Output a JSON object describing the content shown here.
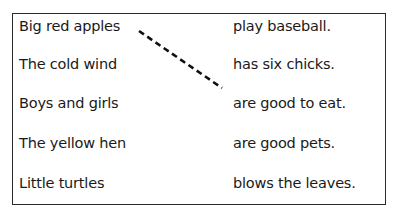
{
  "worksheet": {
    "left_items": [
      {
        "text": "Big red apples"
      },
      {
        "text": "The cold wind"
      },
      {
        "text": "Boys and girls"
      },
      {
        "text": "The yellow hen"
      },
      {
        "text": "Little turtles"
      }
    ],
    "right_items": [
      {
        "text": "play baseball."
      },
      {
        "text": "has six chicks."
      },
      {
        "text": "are good to eat."
      },
      {
        "text": "are good pets."
      },
      {
        "text": "blows the leaves."
      }
    ],
    "connections": [
      {
        "from": "Big red apples",
        "to": "are good to eat.",
        "style": "dashed"
      }
    ]
  }
}
